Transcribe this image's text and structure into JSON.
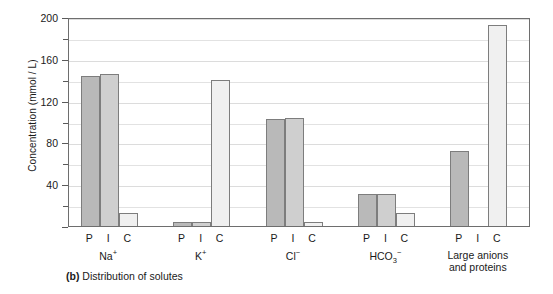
{
  "chart_data": {
    "type": "bar",
    "title": "",
    "caption_prefix": "(b)",
    "caption_text": "Distribution of solutes",
    "xlabel": "",
    "ylabel": "Concentration (mmol / L)",
    "ylim": [
      0,
      200
    ],
    "ytick_major": [
      0,
      40,
      80,
      120,
      160,
      200
    ],
    "ytick_major_labels": [
      "",
      "40",
      "80",
      "120",
      "160",
      "200"
    ],
    "ytick_minor": [
      20,
      60,
      100,
      140,
      180
    ],
    "grid": true,
    "legend": "none",
    "compartment_codes": [
      "P",
      "I",
      "C"
    ],
    "compartment_names": [
      "Plasma",
      "Interstitial fluid",
      "Intracellular fluid"
    ],
    "categories": [
      "Na⁺",
      "K⁺",
      "Cl⁻",
      "HCO₃⁻",
      "Large anions and proteins"
    ],
    "category_labels_html": [
      "Na<sup>+</sup>",
      "K<sup>+</sup>",
      "Cl<sup>−</sup>",
      "HCO<sub>3</sub><sup>−</sup>",
      "Large anions\nand proteins"
    ],
    "series": [
      {
        "name": "P",
        "values": [
          144,
          4,
          102,
          31,
          72
        ]
      },
      {
        "name": "I",
        "values": [
          145,
          4,
          103,
          31,
          0
        ]
      },
      {
        "name": "C",
        "values": [
          12,
          140,
          4,
          12,
          192
        ]
      }
    ],
    "colors": {
      "P": "#b9b9b9",
      "I": "#cfcfcf",
      "C": "#f0f0f0",
      "bar_border": "#7d7d7d",
      "axis": "#6e6e6e",
      "gridline": "#e2e2e2",
      "text": "#1a1a1a",
      "background": "#ffffff"
    }
  }
}
